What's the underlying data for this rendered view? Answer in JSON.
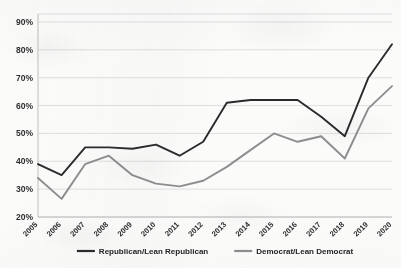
{
  "chart_data": {
    "type": "line",
    "title": "",
    "xlabel": "",
    "ylabel": "",
    "categories": [
      "2005",
      "2006",
      "2007",
      "2008",
      "2009",
      "2010",
      "2011",
      "2012",
      "2013",
      "2014",
      "2015",
      "2016",
      "2017",
      "2018",
      "2019",
      "2020"
    ],
    "series": [
      {
        "name": "Republican/Lean Republican",
        "color": "#2b2b2d",
        "values": [
          39,
          35,
          45,
          45,
          44.5,
          46,
          42,
          47,
          61,
          62,
          62,
          62,
          56,
          49,
          70,
          82
        ]
      },
      {
        "name": "Democrat/Lean Democrat",
        "color": "#8e8e90",
        "values": [
          34,
          26.5,
          39,
          42,
          35,
          32,
          31,
          33,
          38,
          44,
          50,
          47,
          49,
          41,
          59,
          67
        ]
      }
    ],
    "ylim": [
      20,
      90
    ],
    "ytick_step": 10,
    "ytick_labels": [
      "20%",
      "30%",
      "40%",
      "50%",
      "60%",
      "70%",
      "80%",
      "90%"
    ],
    "ytick_values": [
      20,
      30,
      40,
      50,
      60,
      70,
      80,
      90
    ],
    "grid": true,
    "legend_position": "bottom"
  },
  "legend": {
    "items": [
      {
        "label": "Republican/Lean Republican",
        "color": "#2b2b2d"
      },
      {
        "label": "Democrat/Lean Democrat",
        "color": "#8e8e90"
      }
    ]
  }
}
